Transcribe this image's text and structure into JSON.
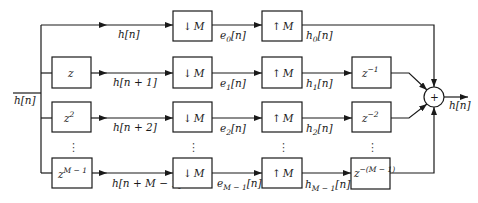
{
  "input": {
    "label": "h[n]"
  },
  "output": {
    "label": "h[n]"
  },
  "summer": {
    "symbol": "+"
  },
  "ellipsis": "⋮",
  "rows": [
    {
      "shift": null,
      "signal": "h[n]",
      "down": {
        "arrow": "↓",
        "factor": "M"
      },
      "e": {
        "base": "e",
        "sub": "0",
        "rest": "[n]"
      },
      "up": {
        "arrow": "↑",
        "factor": "M"
      },
      "h": {
        "base": "h",
        "sub": "0",
        "rest": "[n]"
      },
      "delay": null
    },
    {
      "shift": {
        "base": "z",
        "sup": ""
      },
      "signal": "h[n + 1]",
      "down": {
        "arrow": "↓",
        "factor": "M"
      },
      "e": {
        "base": "e",
        "sub": "1",
        "rest": "[n]"
      },
      "up": {
        "arrow": "↑",
        "factor": "M"
      },
      "h": {
        "base": "h",
        "sub": "1",
        "rest": "[n]"
      },
      "delay": {
        "base": "z",
        "sup": "−1"
      }
    },
    {
      "shift": {
        "base": "z",
        "sup": "2"
      },
      "signal": "h[n + 2]",
      "down": {
        "arrow": "↓",
        "factor": "M"
      },
      "e": {
        "base": "e",
        "sub": "2",
        "rest": "[n]"
      },
      "up": {
        "arrow": "↑",
        "factor": "M"
      },
      "h": {
        "base": "h",
        "sub": "2",
        "rest": "[n]"
      },
      "delay": {
        "base": "z",
        "sup": "−2"
      }
    },
    {
      "shift": {
        "base": "z",
        "sup": "M − 1"
      },
      "signal": "h[n + M − 1]",
      "down": {
        "arrow": "↓",
        "factor": "M"
      },
      "e": {
        "base": "e",
        "sub": "M − 1",
        "rest": "[n]"
      },
      "up": {
        "arrow": "↑",
        "factor": "M"
      },
      "h": {
        "base": "h",
        "sub": "M − 1",
        "rest": "[n]"
      },
      "delay": {
        "base": "z",
        "sup": "−(M − 1)"
      }
    }
  ]
}
